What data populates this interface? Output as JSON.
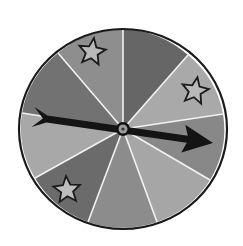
{
  "spinner": {
    "center": [
      123,
      129
    ],
    "rx": 104,
    "ry": 100,
    "rim_color": "#1a1a1a",
    "divider_color": "#f2f2f2",
    "divider_points": [
      [
        123,
        29
      ],
      [
        188,
        55
      ],
      [
        223,
        114
      ],
      [
        210,
        180
      ],
      [
        157,
        222
      ],
      [
        88,
        222
      ],
      [
        35,
        178
      ],
      [
        22,
        113
      ],
      [
        58,
        53
      ]
    ],
    "sectors": [
      {
        "fill": "#666666",
        "star": false
      },
      {
        "fill": "#a9a9a9",
        "star": true
      },
      {
        "fill": "#888888",
        "star": false
      },
      {
        "fill": "#a6a6a6",
        "star": false
      },
      {
        "fill": "#8c8c8c",
        "star": false
      },
      {
        "fill": "#6b6b6b",
        "star": true
      },
      {
        "fill": "#a8a8a8",
        "star": false
      },
      {
        "fill": "#727272",
        "star": false
      },
      {
        "fill": "#8e8e8e",
        "star": true
      }
    ],
    "stars": [
      {
        "cx": 92,
        "cy": 52,
        "r": 14,
        "rotate": 8,
        "fill": "#b9b9b9",
        "stroke": "#1a1a1a"
      },
      {
        "cx": 195,
        "cy": 91,
        "r": 14,
        "rotate": 10,
        "fill": "#b9b9b9",
        "stroke": "#1a1a1a"
      },
      {
        "cx": 67,
        "cy": 190,
        "r": 14,
        "rotate": -4,
        "fill": "#bdbdbd",
        "stroke": "#1a1a1a"
      }
    ],
    "arrow": {
      "color": "#141414",
      "tail": [
        33,
        117
      ],
      "head_tip": [
        213,
        143
      ],
      "shaft_width": 7
    },
    "hub": {
      "outer_r": 7,
      "outer_color": "#111111",
      "mid_r": 4.5,
      "mid_color": "#9a9a9a",
      "inner_r": 1.6,
      "inner_color": "#333333"
    }
  }
}
